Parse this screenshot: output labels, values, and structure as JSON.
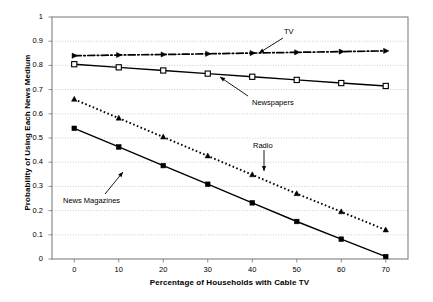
{
  "chart_data": {
    "type": "line",
    "title": "",
    "xlabel": "Percentage of Households with Cable TV",
    "ylabel": "Probability of Using Each News Medium",
    "x": [
      0,
      10,
      20,
      30,
      40,
      50,
      60,
      70
    ],
    "xlim": [
      -5,
      75
    ],
    "ylim": [
      0,
      1
    ],
    "xticks": [
      "0",
      "10",
      "20",
      "30",
      "40",
      "50",
      "60",
      "70"
    ],
    "yticks": [
      "0",
      "0.1",
      "0.2",
      "0.3",
      "0.4",
      "0.5",
      "0.6",
      "0.7",
      "0.8",
      "0.9",
      "1"
    ],
    "grid": "horizontal-dotted",
    "legend": "annotations",
    "series": [
      {
        "name": "TV",
        "values": [
          0.84,
          0.843,
          0.845,
          0.848,
          0.851,
          0.854,
          0.857,
          0.86
        ],
        "line_style": "dash-dot",
        "marker": "arrow",
        "color": "#000000"
      },
      {
        "name": "Newspapers",
        "values": [
          0.805,
          0.792,
          0.779,
          0.766,
          0.753,
          0.74,
          0.727,
          0.715
        ],
        "line_style": "solid",
        "marker": "open-square",
        "color": "#000000"
      },
      {
        "name": "Radio",
        "values": [
          0.66,
          0.582,
          0.504,
          0.426,
          0.348,
          0.27,
          0.195,
          0.12
        ],
        "line_style": "dotted",
        "marker": "filled-triangle",
        "color": "#000000"
      },
      {
        "name": "News Magazines",
        "values": [
          0.54,
          0.463,
          0.386,
          0.309,
          0.232,
          0.155,
          0.082,
          0.01
        ],
        "line_style": "solid",
        "marker": "filled-square",
        "color": "#000000"
      }
    ],
    "annotations": [
      {
        "label": "TV",
        "x_px": 284,
        "y_px": 27,
        "arrow": "down-left"
      },
      {
        "label": "Newspapers",
        "x_px": 252,
        "y_px": 98,
        "arrow": "up-left"
      },
      {
        "label": "Radio",
        "x_px": 253,
        "y_px": 141,
        "arrow": "down"
      },
      {
        "label": "News Magazines",
        "x_px": 63,
        "y_px": 196,
        "arrow": "up-right"
      }
    ]
  },
  "style": {
    "frame_color": "#808080",
    "grid_color": "#b8b8b8",
    "plot_bg": "#ffffff"
  }
}
